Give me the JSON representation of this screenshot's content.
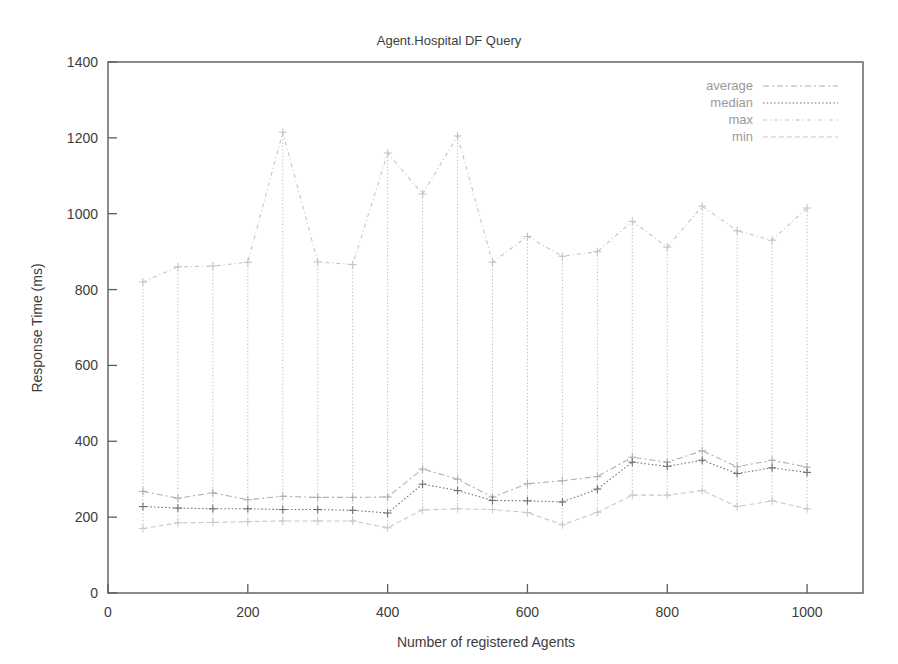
{
  "chart_data": {
    "type": "line",
    "title": "Agent.Hospital DF Query",
    "xlabel": "Number of registered Agents",
    "ylabel": "Response Time (ms)",
    "xlim": [
      0,
      1080
    ],
    "ylim": [
      0,
      1400
    ],
    "xticks": [
      0,
      200,
      400,
      600,
      800,
      1000
    ],
    "yticks": [
      0,
      200,
      400,
      600,
      800,
      1000,
      1200,
      1400
    ],
    "grid": false,
    "legend_position": "top-right",
    "x": [
      50,
      100,
      150,
      200,
      250,
      300,
      350,
      400,
      450,
      500,
      550,
      600,
      650,
      700,
      750,
      800,
      850,
      900,
      950,
      1000
    ],
    "series": [
      {
        "name": "average",
        "color": "#b0b0b0",
        "dash": "6 3 2 3",
        "values": [
          268,
          250,
          264,
          246,
          255,
          252,
          252,
          253,
          327,
          300,
          253,
          288,
          296,
          307,
          358,
          345,
          375,
          333,
          350,
          332
        ]
      },
      {
        "name": "median",
        "color": "#707070",
        "dash": "1.5 2.2",
        "values": [
          228,
          224,
          222,
          222,
          220,
          220,
          218,
          211,
          287,
          270,
          244,
          243,
          240,
          274,
          345,
          334,
          350,
          315,
          330,
          318
        ]
      },
      {
        "name": "max",
        "color": "#c4c4c4",
        "dash": "4 3 1 3",
        "values": [
          820,
          860,
          862,
          872,
          1215,
          873,
          866,
          1160,
          1052,
          1205,
          872,
          940,
          888,
          900,
          980,
          912,
          1020,
          955,
          930,
          1015
        ]
      },
      {
        "name": "min",
        "color": "#c9c9c9",
        "dash": "5 3",
        "values": [
          170,
          185,
          186,
          188,
          190,
          190,
          190,
          172,
          219,
          222,
          220,
          212,
          180,
          212,
          258,
          258,
          270,
          228,
          243,
          222
        ]
      }
    ],
    "legend_entries": [
      "average",
      "median",
      "max",
      "min"
    ],
    "xtick_labels": [
      "0",
      "200",
      "400",
      "600",
      "800",
      "1000"
    ],
    "ytick_labels": [
      "0",
      "200",
      "400",
      "600",
      "800",
      "1000",
      "1200",
      "1400"
    ]
  },
  "colors": {
    "background": "#ffffff",
    "axis": "#5b5b5b",
    "text": "#3d3d3d",
    "legend_text": "#9a9a9a"
  }
}
